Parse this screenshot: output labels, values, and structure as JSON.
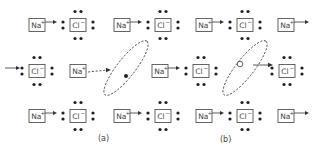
{
  "figure": {
    "panels": [
      {
        "caption": "(a)"
      },
      {
        "caption": "(b)"
      }
    ],
    "ion_labels": {
      "sodium": {
        "symbol": "Na",
        "charge": "+"
      },
      "chloride": {
        "symbol": "Cl",
        "charge": "−"
      }
    },
    "rows": [
      {
        "y": 25,
        "ions": [
          {
            "type": "sodium",
            "x": 29,
            "arrow_out": true
          },
          {
            "type": "chloride",
            "x": 70
          },
          {
            "type": "sodium",
            "x": 114,
            "arrow_out": true
          },
          {
            "type": "chloride",
            "x": 155
          },
          {
            "type": "sodium",
            "x": 196,
            "arrow_out": true
          },
          {
            "type": "chloride",
            "x": 237
          },
          {
            "type": "sodium",
            "x": 278,
            "arrow_out": true
          }
        ]
      },
      {
        "y": 71,
        "ions": [
          {
            "type": "chloride",
            "x": 29,
            "arrow_in": true
          },
          {
            "type": "sodium",
            "x": 70,
            "dashed_arrow": true
          },
          {
            "type": "sodium",
            "x": 152,
            "arrow_out": true
          },
          {
            "type": "chloride",
            "x": 193
          },
          {
            "type": "chloride",
            "x": 279
          }
        ]
      },
      {
        "y": 116,
        "ions": [
          {
            "type": "sodium",
            "x": 29,
            "arrow_out": true
          },
          {
            "type": "chloride",
            "x": 70
          },
          {
            "type": "sodium",
            "x": 114,
            "arrow_out": true
          },
          {
            "type": "chloride",
            "x": 155
          },
          {
            "type": "sodium",
            "x": 196,
            "arrow_out": true
          },
          {
            "type": "chloride",
            "x": 237
          },
          {
            "type": "sodium",
            "x": 278,
            "arrow_out": true
          }
        ]
      }
    ],
    "colors": {
      "line": "#333333",
      "box_stroke": "#555555",
      "dot": "#222222",
      "text": "#444444",
      "background": "#ffffff"
    }
  }
}
